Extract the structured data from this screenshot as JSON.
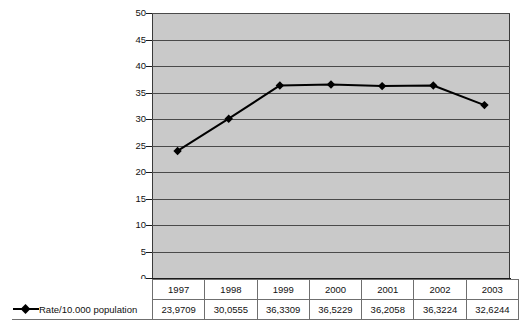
{
  "chart_data": {
    "type": "line",
    "title": "",
    "xlabel": "",
    "ylabel": "",
    "categories": [
      "1997",
      "1998",
      "1999",
      "2000",
      "2001",
      "2002",
      "2003"
    ],
    "series": [
      {
        "name": "Rate/10.000 population",
        "values": [
          23.9709,
          30.0555,
          36.3309,
          36.5229,
          36.2058,
          36.3224,
          32.6244
        ],
        "value_labels": [
          "23,9709",
          "30,0555",
          "36,3309",
          "36,5229",
          "36,2058",
          "36,3224",
          "32,6244"
        ],
        "marker": "diamond",
        "color": "#000000"
      }
    ],
    "ylim": [
      0,
      50
    ],
    "ytick_step": 5,
    "yticks": [
      "50",
      "45",
      "40",
      "35",
      "30",
      "25",
      "20",
      "15",
      "10",
      "5",
      "0"
    ],
    "grid": true,
    "grid_axis": "y",
    "legend_position": "bottom-left",
    "plot_background": "#c9c9c9",
    "page_background": "#ffffff"
  },
  "legend": {
    "entries": [
      {
        "label": "Rate/10.000 population",
        "marker_icon": "diamond-line-marker"
      }
    ]
  },
  "table": {
    "header_row": [
      "1997",
      "1998",
      "1999",
      "2000",
      "2001",
      "2002",
      "2003"
    ],
    "data_rows": [
      {
        "label": "Rate/10.000 population",
        "cells": [
          "23,9709",
          "30,0555",
          "36,3309",
          "36,5229",
          "36,2058",
          "36,3224",
          "32,6244"
        ]
      }
    ]
  }
}
